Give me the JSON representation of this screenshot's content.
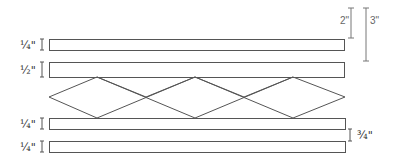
{
  "diagram": {
    "strips": [
      {
        "id": "strip-1",
        "label": "¼\"",
        "x": 49,
        "y": 39,
        "w": 295,
        "h": 11
      },
      {
        "id": "strip-2",
        "label": "½\"",
        "x": 49,
        "y": 62,
        "w": 295,
        "h": 15
      },
      {
        "id": "strip-3",
        "label": "¼\"",
        "x": 49,
        "y": 118,
        "w": 296,
        "h": 11
      },
      {
        "id": "strip-4",
        "label": "¼\"",
        "x": 49,
        "y": 141,
        "w": 296,
        "h": 11
      }
    ],
    "lattice": {
      "top_y": 77,
      "bottom_y": 118,
      "left_x": 49,
      "right_x": 345,
      "diamond_count": 3
    },
    "dimensions": {
      "gap_2in": {
        "label": "2\"",
        "x": 351,
        "y1": 8,
        "y2": 38
      },
      "gap_3in": {
        "label": "3\"",
        "x": 366,
        "y1": 8,
        "y2": 61
      },
      "gap_3_4in": {
        "label": "¾\"",
        "x": 350,
        "y1": 129,
        "y2": 141
      }
    },
    "colors": {
      "line": "#555555",
      "text": "#2a2a2a",
      "dim_text": "#666666",
      "background": "#ffffff"
    }
  }
}
